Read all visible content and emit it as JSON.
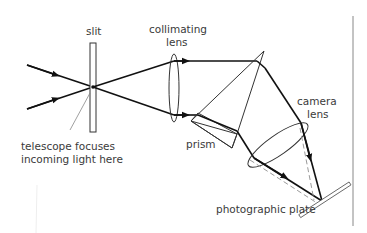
{
  "diagram": {
    "type": "spectrograph schematic",
    "labels": {
      "slit": "slit",
      "collimating_lens_line1": "collimating",
      "collimating_lens_line2": "lens",
      "camera_lens_line1": "camera",
      "camera_lens_line2": "lens",
      "telescope_line1": "telescope focuses",
      "telescope_line2": "incoming light here",
      "prism": "prism",
      "photographic_plate": "photographic plate"
    },
    "colors": {
      "ray": "#111111",
      "outline": "#333333",
      "dashed_ray": "#9a9a9a",
      "label_text": "#3a3a3a",
      "border": "#888888"
    }
  }
}
